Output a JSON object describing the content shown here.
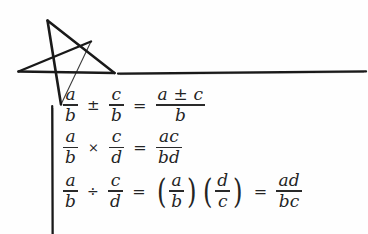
{
  "page": {
    "background_color": "#fefefe",
    "ink_color": "#242424",
    "kind": "handwritten-notebook-page-fraction-rules"
  },
  "decorations": {
    "star": {
      "name": "hand-drawn-five-pointed-star",
      "stroke_color": "#1a1a1a",
      "description": "irregular hand-drawn pentagram sketch"
    },
    "horizontal_rule": {
      "name": "hand-drawn-horizontal-rule",
      "stroke_color": "#1a1a1a"
    },
    "vertical_rule": {
      "name": "hand-drawn-vertical-rule",
      "stroke_color": "#1a1a1a"
    }
  },
  "equations": [
    {
      "id": "addition-subtraction-of-fractions",
      "lhs_num_1": "a",
      "lhs_den_1": "b",
      "operator": "±",
      "lhs_num_2": "c",
      "lhs_den_2": "b",
      "equals": "=",
      "rhs_num": "a ± c",
      "rhs_den": "b",
      "plain": "a/b ± c/b = (a ± c)/b"
    },
    {
      "id": "multiplication-of-fractions",
      "lhs_num_1": "a",
      "lhs_den_1": "b",
      "operator": "×",
      "lhs_num_2": "c",
      "lhs_den_2": "d",
      "equals": "=",
      "rhs_num": "ac",
      "rhs_den": "bd",
      "plain": "a/b × c/d = ac/bd"
    },
    {
      "id": "division-of-fractions",
      "lhs_num_1": "a",
      "lhs_den_1": "b",
      "operator": "÷",
      "lhs_num_2": "c",
      "lhs_den_2": "d",
      "equals": "=",
      "mid_num_1": "a",
      "mid_den_1": "b",
      "mid_num_2": "d",
      "mid_den_2": "c",
      "equals_2": "=",
      "rhs_num": "ad",
      "rhs_den": "bc",
      "paren_open": "(",
      "paren_close": ")",
      "plain": "a/b ÷ c/d = (a/b)(d/c) = ad/bc"
    }
  ]
}
